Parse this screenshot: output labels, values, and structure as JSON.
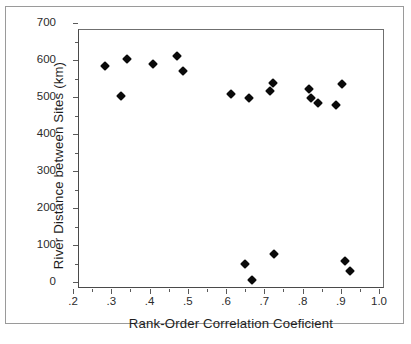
{
  "chart_data": {
    "type": "scatter",
    "title": "",
    "xlabel": "Rank-Order Correlation Coeficient",
    "ylabel": "River Distance between Sites (km)",
    "xlim": [
      0.2,
      1.0
    ],
    "ylim": [
      0,
      700
    ],
    "grid": false,
    "legend": null,
    "marker": "filled-diamond",
    "marker_color": "#0a0a0a",
    "xticks": [
      0.2,
      0.3,
      0.4,
      0.5,
      0.6,
      0.7,
      0.8,
      0.9,
      1.0
    ],
    "xtick_labels": [
      ".2",
      ".3",
      ".4",
      ".5",
      ".6",
      ".7",
      ".8",
      ".9",
      "1.0"
    ],
    "yticks": [
      0,
      100,
      200,
      300,
      400,
      500,
      600,
      700
    ],
    "ytick_labels": [
      "0",
      "100",
      "200",
      "300",
      "400",
      "500",
      "600",
      "700"
    ],
    "xminor_ticks": [
      0.25,
      0.35,
      0.45,
      0.55,
      0.65,
      0.75,
      0.85,
      0.95
    ],
    "yminor_ticks": [
      50,
      150,
      250,
      350,
      450,
      550,
      650
    ],
    "points": [
      {
        "x": 0.283,
        "y": 585
      },
      {
        "x": 0.325,
        "y": 504
      },
      {
        "x": 0.342,
        "y": 602
      },
      {
        "x": 0.408,
        "y": 589
      },
      {
        "x": 0.472,
        "y": 612
      },
      {
        "x": 0.487,
        "y": 571
      },
      {
        "x": 0.612,
        "y": 507
      },
      {
        "x": 0.66,
        "y": 497
      },
      {
        "x": 0.65,
        "y": 50
      },
      {
        "x": 0.668,
        "y": 5
      },
      {
        "x": 0.714,
        "y": 516
      },
      {
        "x": 0.724,
        "y": 537
      },
      {
        "x": 0.725,
        "y": 75
      },
      {
        "x": 0.818,
        "y": 522
      },
      {
        "x": 0.822,
        "y": 496
      },
      {
        "x": 0.84,
        "y": 484
      },
      {
        "x": 0.888,
        "y": 478
      },
      {
        "x": 0.902,
        "y": 535
      },
      {
        "x": 0.911,
        "y": 58
      },
      {
        "x": 0.925,
        "y": 29
      }
    ]
  }
}
